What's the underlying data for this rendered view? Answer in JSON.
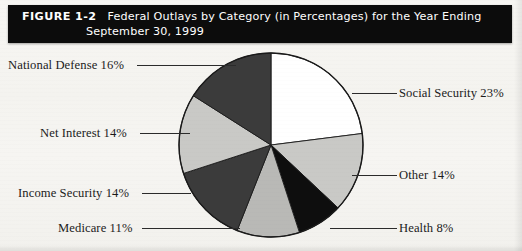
{
  "figure": {
    "number": "FIGURE 1-2",
    "title_line_1": "Federal Outlays by Category (in Percentages) for the Year Ending",
    "title_line_2": "September 30, 1999",
    "title_bar_color": "#0c0c0c",
    "page_background": "#f6f5f2"
  },
  "chart_data": {
    "type": "pie",
    "title": "Federal Outlays by Category (in Percentages) for the Year Ending September 30, 1999",
    "xlabel": "",
    "ylabel": "",
    "units": "percent",
    "total": 100,
    "start_angle_deg": 0,
    "direction": "clockwise",
    "legend": "none",
    "labels_placement": "external with leader lines",
    "categories": [
      "Social Security",
      "Other",
      "Health",
      "Medicare",
      "Income Security",
      "Net Interest",
      "National Defense"
    ],
    "values": [
      23,
      14,
      8,
      11,
      14,
      14,
      16
    ],
    "slices": [
      {
        "name": "Social Security",
        "value": 23,
        "label": "Social Security 23%",
        "fill": "#ffffff",
        "side": "right",
        "label_x": 399,
        "label_y": 86,
        "leader_x": 352,
        "leader_y": 93,
        "leader_w": 45
      },
      {
        "name": "Other",
        "value": 14,
        "label": "Other 14%",
        "fill": "#c9c9c6",
        "side": "right",
        "label_x": 399,
        "label_y": 168,
        "leader_x": 352,
        "leader_y": 175,
        "leader_w": 45
      },
      {
        "name": "Health",
        "value": 8,
        "label": "Health 8%",
        "fill": "#0e0e0e",
        "side": "right",
        "label_x": 399,
        "label_y": 221,
        "leader_x": 330,
        "leader_y": 228,
        "leader_w": 67
      },
      {
        "name": "Medicare",
        "value": 11,
        "label": "Medicare 11%",
        "fill": "#b9b9b6",
        "side": "left",
        "label_x": 58,
        "label_y": 221,
        "leader_x": 142,
        "leader_y": 228,
        "leader_w": 98
      },
      {
        "name": "Income Security",
        "value": 14,
        "label": "Income Security 14%",
        "fill": "#3b3b3b",
        "side": "left",
        "label_x": 18,
        "label_y": 186,
        "leader_x": 142,
        "leader_y": 193,
        "leader_w": 49
      },
      {
        "name": "Net Interest",
        "value": 14,
        "label": "Net Interest 14%",
        "fill": "#c9c9c6",
        "side": "left",
        "label_x": 40,
        "label_y": 126,
        "leader_x": 140,
        "leader_y": 133,
        "leader_w": 50
      },
      {
        "name": "National Defense",
        "value": 16,
        "label": "National Defense 16%",
        "fill": "#3b3b3b",
        "side": "left",
        "label_x": 8,
        "label_y": 58,
        "leader_x": 137,
        "leader_y": 65,
        "leader_w": 99
      }
    ],
    "geometry": {
      "center_x": 94,
      "center_y": 95,
      "radius": 92,
      "stroke": "#1a1a1a",
      "stroke_width": 1.4
    }
  }
}
